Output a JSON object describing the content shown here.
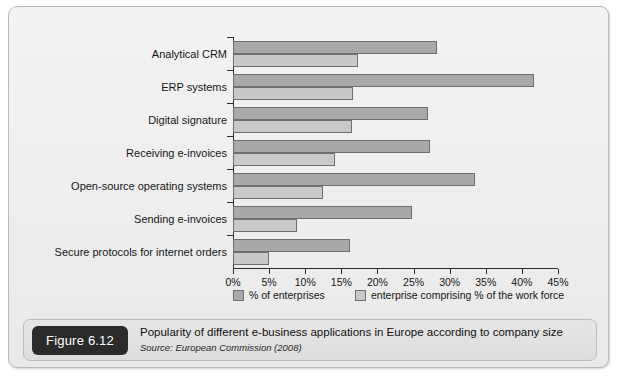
{
  "figure": {
    "badge_label": "Figure 6.12",
    "caption_title": "Popularity of different e-business applications in Europe according to company size",
    "caption_source": "Source: European Commission (2008)"
  },
  "legend": {
    "series_a_label": "% of enterprises",
    "series_b_label": "enterprise comprising % of the work force"
  },
  "chart_data": {
    "type": "bar",
    "orientation": "horizontal",
    "title": "Popularity of different e-business applications in Europe according to company size",
    "subtitle": "Source: European Commission (2008)",
    "xlabel": "",
    "ylabel": "",
    "xlim": [
      0,
      45
    ],
    "x_tick_labels": [
      "0%",
      "5%",
      "10%",
      "15%",
      "20%",
      "25%",
      "30%",
      "35%",
      "40%",
      "45%"
    ],
    "x_ticks": [
      0,
      5,
      10,
      15,
      20,
      25,
      30,
      35,
      40,
      45
    ],
    "grid": false,
    "legend_position": "bottom",
    "categories": [
      "Analytical CRM",
      "ERP systems",
      "Digital signature",
      "Receiving e-invoices",
      "Open-source operating systems",
      "Sending e-invoices",
      "Secure protocols for internet orders"
    ],
    "series": [
      {
        "name": "% of enterprises",
        "color": "#a9a9a9",
        "values": [
          28.2,
          41.7,
          27.0,
          27.3,
          33.5,
          24.8,
          16.2
        ]
      },
      {
        "name": "enterprise comprising % of the work force",
        "color": "#c9c9c9",
        "values": [
          17.3,
          16.6,
          16.5,
          14.1,
          12.5,
          8.9,
          5.0
        ]
      }
    ]
  }
}
